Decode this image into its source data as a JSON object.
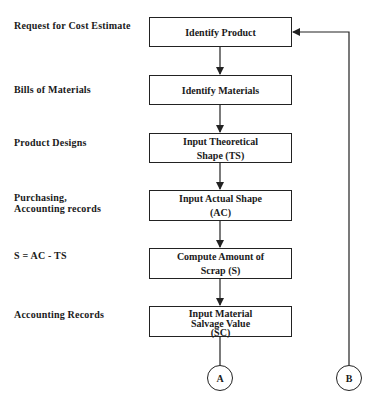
{
  "inputs": [
    {
      "lines": [
        "Request for Cost Estimate"
      ]
    },
    {
      "lines": [
        "Bills of Materials"
      ]
    },
    {
      "lines": [
        "Product Designs"
      ]
    },
    {
      "lines": [
        "Purchasing,",
        "Accounting records"
      ]
    },
    {
      "lines": [
        "S = AC - TS"
      ]
    },
    {
      "lines": [
        "Accounting Records"
      ]
    }
  ],
  "steps": [
    {
      "lines": [
        "Identify Product"
      ]
    },
    {
      "lines": [
        "Identify Materials"
      ]
    },
    {
      "lines": [
        "Input Theoretical",
        "Shape (TS)"
      ]
    },
    {
      "lines": [
        "Input Actual Shape",
        "(AC)"
      ]
    },
    {
      "lines": [
        "Compute Amount of",
        "Scrap (S)"
      ]
    },
    {
      "lines": [
        "Input Material",
        "Salvage Value",
        "(SC)"
      ]
    }
  ],
  "connectors": {
    "a": "A",
    "b": "B"
  }
}
